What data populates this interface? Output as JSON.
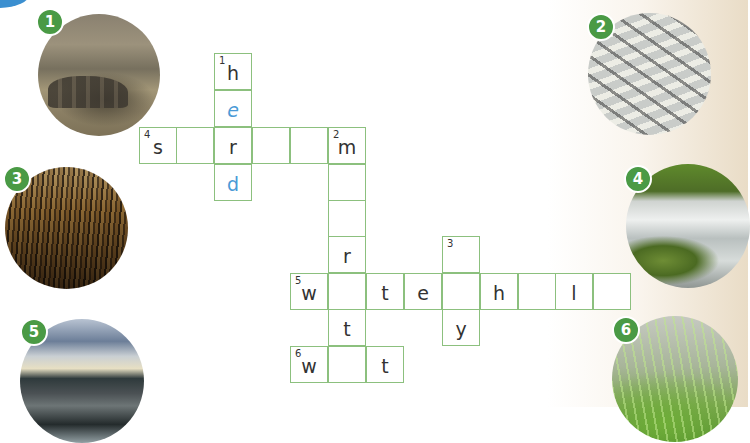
{
  "exercise": {
    "photos": [
      {
        "number": "1",
        "label": "elephant-herd",
        "colors": {
          "badge": "#4a9a45"
        }
      },
      {
        "number": "2",
        "label": "migrating-geese"
      },
      {
        "number": "3",
        "label": "dry-corn-field"
      },
      {
        "number": "4",
        "label": "river-stream"
      },
      {
        "number": "5",
        "label": "wetland-sunset"
      },
      {
        "number": "6",
        "label": "wet-grass"
      }
    ]
  },
  "crossword": {
    "cell_size": 38,
    "origin": {
      "x": 139,
      "y": 53
    },
    "border_color": "#8cc07e",
    "given_color": "#4a9ad6",
    "clue_numbers": {
      "1": "1",
      "2": "2",
      "3": "3",
      "4": "4",
      "5": "5",
      "6": "6"
    },
    "words": [
      {
        "number": "1",
        "direction": "down",
        "cells": [
          "h",
          "e",
          "r",
          "d"
        ]
      },
      {
        "number": "2",
        "direction": "down",
        "cells": [
          "m",
          "",
          "",
          "r",
          "",
          "t",
          ""
        ]
      },
      {
        "number": "3",
        "direction": "down",
        "cells": [
          "",
          "",
          "y"
        ]
      },
      {
        "number": "4",
        "direction": "across",
        "cells": [
          "s",
          "",
          "r",
          "",
          "",
          "m"
        ]
      },
      {
        "number": "5",
        "direction": "across",
        "cells": [
          "w",
          "",
          "t",
          "e",
          "",
          "h",
          "",
          "l",
          ""
        ]
      },
      {
        "number": "6",
        "direction": "across",
        "cells": [
          "w",
          "",
          "t"
        ]
      }
    ],
    "cells": {
      "r0c2": "h",
      "r1c2": "e",
      "r2c0": "s",
      "r2c1": "",
      "r2c2": "r",
      "r2c3": "",
      "r2c4": "",
      "r2c5": "m",
      "r3c2": "d",
      "r3c5": "",
      "r4c5": "",
      "r5c5": "r",
      "r5c8": "",
      "r6c4": "w",
      "r6c5": "",
      "r6c6": "t",
      "r6c7": "e",
      "r6c8": "",
      "r6c9": "h",
      "r6c10": "",
      "r6c11": "l",
      "r6c12": "",
      "r7c5": "t",
      "r7c8": "y",
      "r8c4": "w",
      "r8c5": "",
      "r8c6": "t"
    }
  }
}
